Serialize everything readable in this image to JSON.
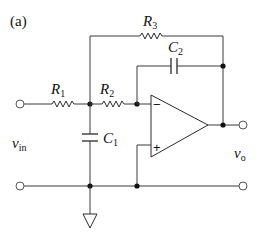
{
  "figure": {
    "tag": "(a)"
  },
  "labels": {
    "R1": {
      "main": "R",
      "sub": "1"
    },
    "R2": {
      "main": "R",
      "sub": "2"
    },
    "R3": {
      "main": "R",
      "sub": "3"
    },
    "C1": {
      "main": "C",
      "sub": "1"
    },
    "C2": {
      "main": "C",
      "sub": "2"
    },
    "vin": {
      "main": "v",
      "sub": "in"
    },
    "vo": {
      "main": "v",
      "sub": "o"
    }
  },
  "opamp": {
    "inverting_sign": "−",
    "noninverting_sign": "+"
  },
  "colors": {
    "wire": "#3a3a3a",
    "node": "#111111",
    "background": "#ffffff"
  }
}
